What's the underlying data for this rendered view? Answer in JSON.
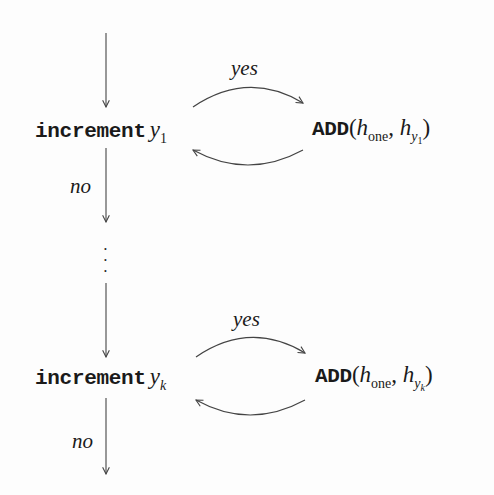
{
  "diagram": {
    "type": "flowchart",
    "stages": [
      {
        "index": "1",
        "node": {
          "keyword": "increment",
          "variable": "y",
          "subscript": "1"
        },
        "action": {
          "op": "ADD",
          "open": "(",
          "arg1_base": "h",
          "arg1_sub": "one",
          "sep": ", ",
          "arg2_base": "h",
          "arg2_sub_base": "y",
          "arg2_sub_sub": "1",
          "close": ")"
        },
        "yes_label": "yes",
        "no_label": "no"
      },
      {
        "index": "k",
        "node": {
          "keyword": "increment",
          "variable": "y",
          "subscript": "k"
        },
        "action": {
          "op": "ADD",
          "open": "(",
          "arg1_base": "h",
          "arg1_sub": "one",
          "sep": ", ",
          "arg2_base": "h",
          "arg2_sub_base": "y",
          "arg2_sub_sub": "k",
          "close": ")"
        },
        "yes_label": "yes",
        "no_label": "no"
      }
    ],
    "ellipsis": "⋮",
    "colors": {
      "ink": "#1a1a1a",
      "line": "#555555",
      "background": "#fdfdfd"
    }
  }
}
